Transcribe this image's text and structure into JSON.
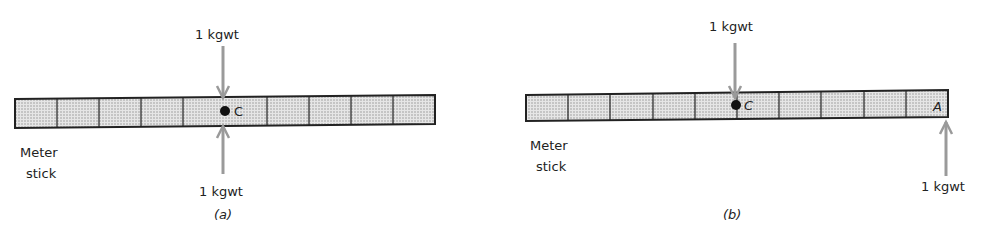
{
  "panels": [
    {
      "id": "a",
      "caption": "(a)",
      "stick_label_line1": "Meter",
      "stick_label_line2": "stick",
      "point_c": "C",
      "force_top": "1 kgwt",
      "force_bottom": "1 kgwt",
      "cells": 10
    },
    {
      "id": "b",
      "caption": "(b)",
      "stick_label_line1": "Meter",
      "stick_label_line2": "stick",
      "point_c": "C",
      "point_a": "A",
      "force_top": "1 kgwt",
      "force_bottom": "1 kgwt",
      "cells": 10
    }
  ],
  "colors": {
    "arrow": "#9a9a9a",
    "stick_fill": "#d9d9d9",
    "outline": "#222222"
  }
}
